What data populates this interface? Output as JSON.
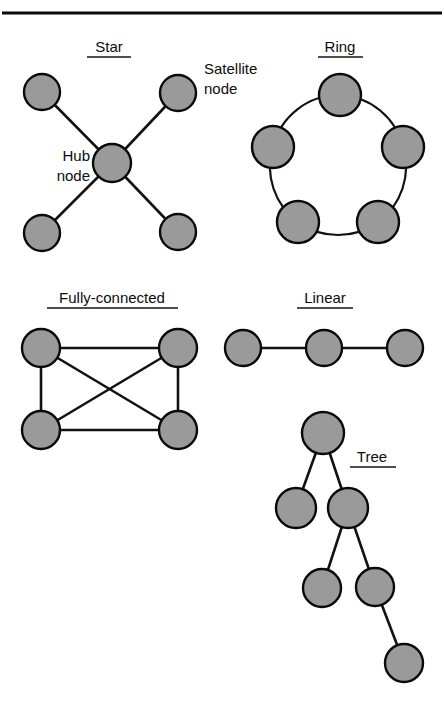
{
  "figure": {
    "kind": "network-topology-diagram",
    "background_color": "#ffffff",
    "node_fill_color": "#9a9a9a",
    "node_stroke_color": "#0a0a0a",
    "edge_color": "#121212",
    "text_color": "#0d0d0d"
  },
  "top_rule": {
    "label": "horizontal-rule"
  },
  "topologies": {
    "star": {
      "title": "Star",
      "hub_label_line1": "Hub",
      "hub_label_line2": "node",
      "satellite_label_line1": "Satellite",
      "satellite_label_line2": "node",
      "node_count": 5,
      "edge_count": 4
    },
    "ring": {
      "title": "Ring",
      "node_count": 5,
      "edge_count": 5
    },
    "fully_connected": {
      "title": "Fully-connected",
      "node_count": 4,
      "edge_count": 6
    },
    "linear": {
      "title": "Linear",
      "node_count": 3,
      "edge_count": 2
    },
    "tree": {
      "title": "Tree",
      "node_count": 6,
      "edge_count": 5
    }
  }
}
